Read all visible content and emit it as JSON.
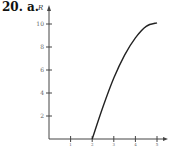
{
  "problem": {
    "number": "20.",
    "part": "a."
  },
  "chart_data": {
    "type": "line",
    "title": "",
    "xlabel": "",
    "ylabel": "R",
    "xlim": [
      0,
      5.3
    ],
    "ylim": [
      0,
      11
    ],
    "x_ticks": [
      1,
      2,
      3,
      4,
      5
    ],
    "y_ticks": [
      2,
      4,
      6,
      8,
      10
    ],
    "grid": false,
    "series": [
      {
        "name": "R",
        "x": [
          2.0,
          2.5,
          3.0,
          3.5,
          4.0,
          4.5,
          5.0
        ],
        "y": [
          0.0,
          2.8,
          5.3,
          7.3,
          8.8,
          9.8,
          10.1
        ]
      }
    ]
  },
  "colors": {
    "axis": "#444444",
    "curve": "#222222",
    "tick_label": "#666666"
  }
}
